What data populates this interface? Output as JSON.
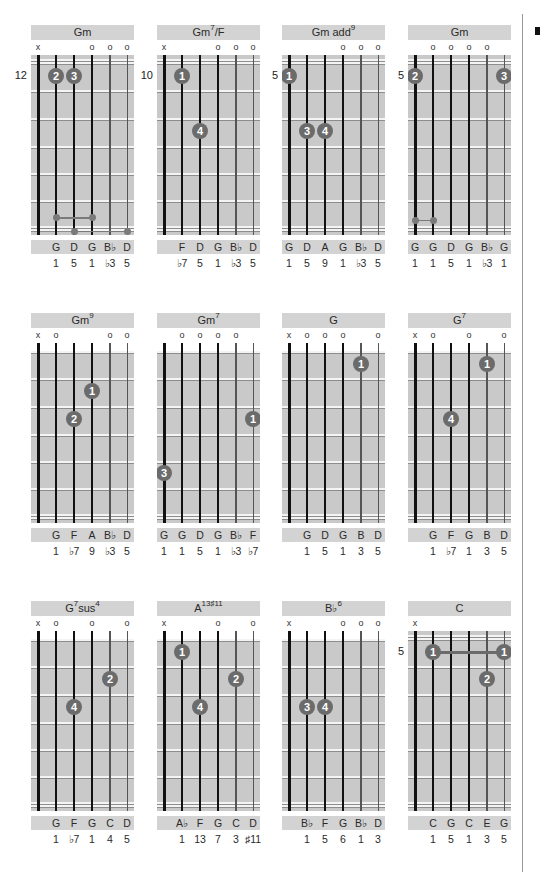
{
  "page": {
    "side_tab_color": "#111111",
    "colors": {
      "fretboard": "#c9c9c9",
      "title_bar": "#d3d3d3",
      "finger_dot": "#6b6b6b",
      "string": "#111111"
    }
  },
  "diagrams": [
    {
      "id": "gm-12",
      "name": "Gm",
      "sup": "",
      "suffix": "",
      "position": "12",
      "open": false,
      "markers": [
        "x",
        "",
        "",
        "o",
        "o",
        "o"
      ],
      "fingers": [
        {
          "string": 1,
          "fret": 1,
          "label": "2"
        },
        {
          "string": 2,
          "fret": 1,
          "label": "3"
        }
      ],
      "barres": [],
      "thumb_links": [
        {
          "from": 1,
          "to": 3,
          "fret": 6.2
        },
        {
          "from": 2,
          "to": 5,
          "fret": 6.7
        }
      ],
      "notes": [
        "",
        "G",
        "D",
        "G",
        "B♭",
        "D"
      ],
      "degrees": [
        "",
        "1",
        "5",
        "1",
        "♭3",
        "5"
      ]
    },
    {
      "id": "gm7f-10",
      "name": "Gm",
      "sup": "7",
      "suffix": "/F",
      "position": "10",
      "open": false,
      "markers": [
        "x",
        "",
        "",
        "o",
        "o",
        "o"
      ],
      "fingers": [
        {
          "string": 1,
          "fret": 1,
          "label": "1"
        },
        {
          "string": 2,
          "fret": 3,
          "label": "4"
        }
      ],
      "barres": [],
      "thumb_links": [],
      "notes": [
        "",
        "F",
        "D",
        "G",
        "B♭",
        "D"
      ],
      "degrees": [
        "",
        "♭7",
        "5",
        "1",
        "♭3",
        "5"
      ]
    },
    {
      "id": "gmadd9-5",
      "name": "Gm add",
      "sup": "9",
      "suffix": "",
      "position": "5",
      "open": false,
      "markers": [
        "",
        "",
        "",
        "o",
        "o",
        "o"
      ],
      "fingers": [
        {
          "string": 0,
          "fret": 1,
          "label": "1"
        },
        {
          "string": 1,
          "fret": 3,
          "label": "3"
        },
        {
          "string": 2,
          "fret": 3,
          "label": "4"
        }
      ],
      "barres": [],
      "thumb_links": [],
      "notes": [
        "G",
        "D",
        "A",
        "G",
        "B♭",
        "D"
      ],
      "degrees": [
        "1",
        "5",
        "9",
        "1",
        "♭3",
        "5"
      ]
    },
    {
      "id": "gm-5",
      "name": "Gm",
      "sup": "",
      "suffix": "",
      "position": "5",
      "open": false,
      "markers": [
        "",
        "o",
        "o",
        "o",
        "o",
        ""
      ],
      "fingers": [
        {
          "string": 0,
          "fret": 1,
          "label": "2"
        },
        {
          "string": 5,
          "fret": 1,
          "label": "3"
        }
      ],
      "barres": [],
      "thumb_links": [
        {
          "from": 0,
          "to": 1,
          "fret": 6.3
        }
      ],
      "notes": [
        "G",
        "G",
        "D",
        "G",
        "B♭",
        "G"
      ],
      "degrees": [
        "1",
        "1",
        "5",
        "1",
        "♭3",
        "1"
      ]
    },
    {
      "id": "gm9",
      "name": "Gm",
      "sup": "9",
      "suffix": "",
      "position": "",
      "open": true,
      "markers": [
        "x",
        "o",
        "",
        "",
        "o",
        "o"
      ],
      "fingers": [
        {
          "string": 3,
          "fret": 2,
          "label": "1"
        },
        {
          "string": 2,
          "fret": 3,
          "label": "2"
        }
      ],
      "barres": [],
      "thumb_links": [],
      "notes": [
        "",
        "G",
        "F",
        "A",
        "B♭",
        "D"
      ],
      "degrees": [
        "",
        "1",
        "♭7",
        "9",
        "♭3",
        "5"
      ]
    },
    {
      "id": "gm7",
      "name": "Gm",
      "sup": "7",
      "suffix": "",
      "position": "",
      "open": true,
      "markers": [
        "",
        "o",
        "o",
        "o",
        "o",
        ""
      ],
      "fingers": [
        {
          "string": 5,
          "fret": 3,
          "label": "1"
        },
        {
          "string": 0,
          "fret": 5,
          "label": "3"
        }
      ],
      "barres": [],
      "thumb_links": [],
      "notes": [
        "G",
        "G",
        "D",
        "G",
        "B♭",
        "F"
      ],
      "degrees": [
        "1",
        "1",
        "5",
        "1",
        "♭3",
        "♭7"
      ]
    },
    {
      "id": "g",
      "name": "G",
      "sup": "",
      "suffix": "",
      "position": "",
      "open": true,
      "markers": [
        "x",
        "o",
        "o",
        "o",
        "",
        "o"
      ],
      "fingers": [
        {
          "string": 4,
          "fret": 1,
          "label": "1"
        }
      ],
      "barres": [],
      "thumb_links": [],
      "notes": [
        "",
        "G",
        "D",
        "G",
        "B",
        "D"
      ],
      "degrees": [
        "",
        "1",
        "5",
        "1",
        "3",
        "5"
      ]
    },
    {
      "id": "g7",
      "name": "G",
      "sup": "7",
      "suffix": "",
      "position": "",
      "open": true,
      "markers": [
        "x",
        "o",
        "",
        "o",
        "",
        "o"
      ],
      "fingers": [
        {
          "string": 4,
          "fret": 1,
          "label": "1"
        },
        {
          "string": 2,
          "fret": 3,
          "label": "4"
        }
      ],
      "barres": [],
      "thumb_links": [],
      "notes": [
        "",
        "G",
        "F",
        "G",
        "B",
        "D"
      ],
      "degrees": [
        "",
        "1",
        "♭7",
        "1",
        "3",
        "5"
      ]
    },
    {
      "id": "g7sus4",
      "name": "G",
      "sup": "7",
      "suffix": "sus",
      "sup2": "4",
      "position": "",
      "open": true,
      "markers": [
        "x",
        "o",
        "",
        "o",
        "",
        "o"
      ],
      "fingers": [
        {
          "string": 4,
          "fret": 2,
          "label": "2"
        },
        {
          "string": 2,
          "fret": 3,
          "label": "4"
        }
      ],
      "barres": [],
      "thumb_links": [],
      "notes": [
        "",
        "G",
        "F",
        "G",
        "C",
        "D"
      ],
      "degrees": [
        "",
        "1",
        "♭7",
        "1",
        "4",
        "5"
      ]
    },
    {
      "id": "a13s11",
      "name": "A",
      "sup": "13♯11",
      "suffix": "",
      "position": "",
      "open": true,
      "markers": [
        "x",
        "",
        "",
        "o",
        "",
        "o"
      ],
      "fingers": [
        {
          "string": 1,
          "fret": 1,
          "label": "1"
        },
        {
          "string": 4,
          "fret": 2,
          "label": "2"
        },
        {
          "string": 2,
          "fret": 3,
          "label": "4"
        }
      ],
      "barres": [],
      "thumb_links": [],
      "notes": [
        "",
        "A♭",
        "F",
        "G",
        "C",
        "D"
      ],
      "degrees": [
        "",
        "1",
        "13",
        "7",
        "3",
        "♯11"
      ]
    },
    {
      "id": "bb6",
      "name": "B♭",
      "sup": "6",
      "suffix": "",
      "position": "",
      "open": true,
      "markers": [
        "x",
        "",
        "",
        "o",
        "o",
        "o"
      ],
      "fingers": [
        {
          "string": 1,
          "fret": 3,
          "label": "3"
        },
        {
          "string": 2,
          "fret": 3,
          "label": "4"
        }
      ],
      "barres": [],
      "thumb_links": [],
      "notes": [
        "",
        "B♭",
        "F",
        "G",
        "B♭",
        "D"
      ],
      "degrees": [
        "",
        "1",
        "5",
        "6",
        "1",
        "3"
      ]
    },
    {
      "id": "c-5",
      "name": "C",
      "sup": "",
      "suffix": "",
      "position": "5",
      "open": false,
      "markers": [
        "x",
        "",
        "",
        "",
        "",
        ""
      ],
      "fingers": [
        {
          "string": 1,
          "fret": 1,
          "label": "1"
        },
        {
          "string": 5,
          "fret": 1,
          "label": "1"
        },
        {
          "string": 4,
          "fret": 2,
          "label": "2"
        }
      ],
      "barres": [
        {
          "from": 1,
          "to": 5,
          "fret": 1
        }
      ],
      "thumb_links": [],
      "notes": [
        "",
        "C",
        "G",
        "C",
        "E",
        "G"
      ],
      "degrees": [
        "",
        "1",
        "5",
        "1",
        "3",
        "5"
      ]
    }
  ]
}
